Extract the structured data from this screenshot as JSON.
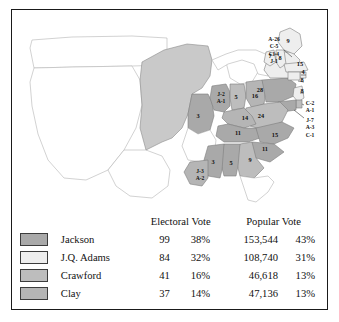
{
  "figure": {
    "border_color": "#1a1a1a",
    "background": "#ffffff"
  },
  "candidate_colors": {
    "jackson": "#a9a9a9",
    "adams": "#eeeeee",
    "crawford": "#bdbdbd",
    "clay": "#b5b5b5",
    "territory": "#ffffff",
    "unorganized": "#c9c9c9"
  },
  "map": {
    "name": "united-states-1824-electoral-map",
    "state_labels": [
      {
        "id": "maine",
        "text": "9",
        "x": 276,
        "y": 33
      },
      {
        "id": "vermont",
        "text": "7",
        "x": 258,
        "y": 48
      },
      {
        "id": "new-hampshire",
        "text": "8",
        "x": 268,
        "y": 50
      },
      {
        "id": "massachusetts",
        "text": "15",
        "x": 288,
        "y": 56
      },
      {
        "id": "rhode-island",
        "text": "4",
        "x": 291,
        "y": 64
      },
      {
        "id": "connecticut",
        "text": "8",
        "x": 290,
        "y": 72
      },
      {
        "id": "new-jersey",
        "text": "8",
        "x": 290,
        "y": 83
      },
      {
        "id": "pennsylvania",
        "text": "28",
        "x": 248,
        "y": 82
      },
      {
        "id": "virginia",
        "text": "24",
        "x": 249,
        "y": 108
      },
      {
        "id": "north-carolina",
        "text": "15",
        "x": 263,
        "y": 127
      },
      {
        "id": "south-carolina",
        "text": "11",
        "x": 253,
        "y": 141
      },
      {
        "id": "georgia",
        "text": "9",
        "x": 238,
        "y": 152
      },
      {
        "id": "alabama",
        "text": "5",
        "x": 219,
        "y": 155
      },
      {
        "id": "mississippi",
        "text": "3",
        "x": 201,
        "y": 154
      },
      {
        "id": "tennessee",
        "text": "11",
        "x": 226,
        "y": 125
      },
      {
        "id": "kentucky",
        "text": "14",
        "x": 233,
        "y": 110
      },
      {
        "id": "ohio",
        "text": "16",
        "x": 243,
        "y": 88
      },
      {
        "id": "indiana",
        "text": "5",
        "x": 224,
        "y": 89
      },
      {
        "id": "missouri",
        "text": "3",
        "x": 186,
        "y": 108
      }
    ],
    "split_labels": [
      {
        "id": "new-york",
        "lines": [
          "A-26",
          "C-5",
          "Cl-4",
          "J-1"
        ],
        "x": 262,
        "y": 31
      },
      {
        "id": "illinois",
        "lines": [
          "J-2",
          "A-1"
        ],
        "x": 209,
        "y": 86
      },
      {
        "id": "louisiana",
        "lines": [
          "J-3",
          "A-2"
        ],
        "x": 188,
        "y": 163
      },
      {
        "id": "delaware",
        "lines": [
          "C-2",
          "A-1"
        ],
        "x": 298,
        "y": 95
      },
      {
        "id": "maryland",
        "lines": [
          "J-7",
          "A-3",
          "C-1"
        ],
        "x": 298,
        "y": 112
      }
    ]
  },
  "table": {
    "headers": {
      "electoral": "Electoral Vote",
      "popular": "Popular Vote"
    },
    "rows": [
      {
        "name": "Jackson",
        "color": "#a9a9a9",
        "electoral_votes": "99",
        "electoral_pct": "38%",
        "popular_votes": "153,544",
        "popular_pct": "43%"
      },
      {
        "name": "J.Q. Adams",
        "color": "#eeeeee",
        "electoral_votes": "84",
        "electoral_pct": "32%",
        "popular_votes": "108,740",
        "popular_pct": "31%"
      },
      {
        "name": "Crawford",
        "color": "#bdbdbd",
        "electoral_votes": "41",
        "electoral_pct": "16%",
        "popular_votes": "46,618",
        "popular_pct": "13%"
      },
      {
        "name": "Clay",
        "color": "#b5b5b5",
        "electoral_votes": "37",
        "electoral_pct": "14%",
        "popular_votes": "47,136",
        "popular_pct": "13%"
      }
    ]
  }
}
